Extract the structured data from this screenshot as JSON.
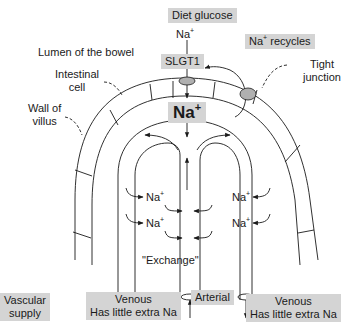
{
  "diagram": {
    "top_labels": {
      "diet_glucose": "Diet glucose",
      "na_entering_base": "Na",
      "na_entering_sup": "+",
      "na_recycles_base": "Na",
      "na_recycles_sup": "+",
      "na_recycles_suffix": " recycles",
      "slgt1": "SLGT1",
      "lumen": "Lumen of the bowel",
      "intestinal_cell_line1": "Intestinal",
      "intestinal_cell_line2": "cell",
      "tight_junction_line1": "Tight",
      "tight_junction_line2": "junction",
      "wall_line1": "Wall of",
      "wall_line2": "villus"
    },
    "center": {
      "na_big_base": "Na",
      "na_big_sup": "+"
    },
    "ions": [
      {
        "base": "Na",
        "sup": "+",
        "side": "left"
      },
      {
        "base": "Na",
        "sup": "+",
        "side": "right"
      },
      {
        "base": "Na",
        "sup": "+",
        "side": "left"
      },
      {
        "base": "Na",
        "sup": "+",
        "side": "right"
      }
    ],
    "exchange_label": "\"Exchange\"",
    "bottom_labels": {
      "vascular_line1": "Vascular",
      "vascular_line2": "supply",
      "venous_left_line1": "Venous",
      "venous_left_line2": "Has little extra Na",
      "arterial": "Arterial",
      "venous_right_line1": "Venous",
      "venous_right_line2": "Has little extra Na"
    },
    "colors": {
      "label_box": "#d4d4d4",
      "transporter_fill": "#b0b0b0",
      "line": "#1a1a1a"
    }
  }
}
